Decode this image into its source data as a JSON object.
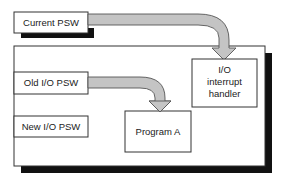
{
  "diagram": {
    "nodes": {
      "current_psw": {
        "label": "Current PSW"
      },
      "old_io_psw": {
        "label": "Old I/O PSW"
      },
      "new_io_psw": {
        "label": "New I/O PSW"
      },
      "io_handler": {
        "label_lines": [
          "I/O",
          "interrupt",
          "handler"
        ]
      },
      "program_a": {
        "label": "Program A"
      }
    },
    "edges": [
      {
        "from": "current_psw",
        "to": "io_handler",
        "style": "thick-gray-curved-arrow"
      },
      {
        "from": "old_io_psw",
        "to": "program_a",
        "style": "thick-gray-curved-arrow"
      }
    ],
    "colors": {
      "box_border": "#333333",
      "shadow": "#111111",
      "arrow_fill": "#c4c4c4",
      "arrow_stroke": "#555555",
      "text": "#222222"
    }
  }
}
